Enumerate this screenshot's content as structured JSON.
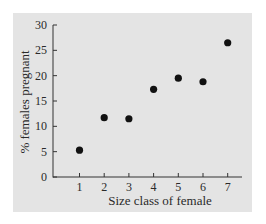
{
  "chart_data": {
    "type": "scatter",
    "title": "",
    "xlabel": "Size class of female",
    "ylabel": "% females pregnant",
    "x": [
      1,
      2,
      3,
      4,
      5,
      6,
      7
    ],
    "values": [
      5.3,
      11.7,
      11.5,
      17.3,
      19.5,
      18.8,
      26.5
    ],
    "series": [
      {
        "name": "% females pregnant",
        "x": [
          1,
          2,
          3,
          4,
          5,
          6,
          7
        ],
        "values": [
          5.3,
          11.7,
          11.5,
          17.3,
          19.5,
          18.8,
          26.5
        ]
      }
    ],
    "xticks": [
      "1",
      "2",
      "3",
      "4",
      "5",
      "6",
      "7"
    ],
    "yticks": [
      "0",
      "5",
      "10",
      "15",
      "20",
      "25",
      "30"
    ],
    "xlim": [
      0,
      7.6
    ],
    "ylim": [
      0,
      30
    ],
    "grid": false,
    "legend": null,
    "colors": {
      "background": "#e4e4e4",
      "marker": "#111111",
      "axis": "#333333"
    }
  }
}
